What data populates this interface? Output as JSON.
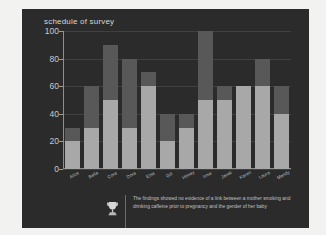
{
  "chart_data": {
    "type": "bar",
    "title": "schedule of survey",
    "xlabel": "",
    "ylabel": "",
    "ylim": [
      0,
      100
    ],
    "yticks": [
      0,
      20,
      40,
      60,
      80,
      100
    ],
    "grid": false,
    "legend": "none",
    "stacked": true,
    "categories": [
      "Alice",
      "Bella",
      "Cora",
      "Dora",
      "Elsa",
      "Gill",
      "Honey",
      "Irnie",
      "Janet",
      "Karen",
      "Laura",
      "Mandy"
    ],
    "series": [
      {
        "name": "lower",
        "color": "#a8a8a8",
        "values": [
          20,
          30,
          50,
          30,
          60,
          20,
          30,
          50,
          50,
          60,
          60,
          40
        ]
      },
      {
        "name": "upper",
        "color": "#585858",
        "values": [
          10,
          30,
          40,
          50,
          10,
          20,
          10,
          50,
          10,
          0,
          20,
          20
        ]
      }
    ],
    "totals": [
      30,
      60,
      90,
      80,
      70,
      40,
      40,
      100,
      60,
      60,
      80,
      60
    ]
  },
  "note": {
    "icon": "trophy-icon",
    "text": "The findings showed no evidence of a link between a mother smoking and drinking caffeine prior to pregnancy and the gender of her baby"
  },
  "colors": {
    "panel_background": "#2b2b2b",
    "page_background": "#f2f2f0",
    "axis": "#8e8e8e",
    "text": "#c9c9c9",
    "bar_light": "#a8a8a8",
    "bar_dark": "#585858"
  }
}
